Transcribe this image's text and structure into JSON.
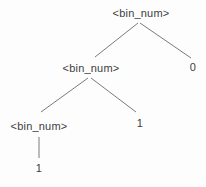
{
  "diagram": {
    "type": "parse-tree",
    "nodes": [
      {
        "id": "root",
        "label": "<bin_num>",
        "role": "nonterminal",
        "level": 0
      },
      {
        "id": "bin-num-2",
        "label": "<bin_num>",
        "role": "nonterminal",
        "level": 1
      },
      {
        "id": "leaf-0",
        "label": "0",
        "role": "terminal",
        "level": 1
      },
      {
        "id": "bin-num-3",
        "label": "<bin_num>",
        "role": "nonterminal",
        "level": 2
      },
      {
        "id": "leaf-1-mid",
        "label": "1",
        "role": "terminal",
        "level": 2
      },
      {
        "id": "leaf-1-bot",
        "label": "1",
        "role": "terminal",
        "level": 3
      }
    ],
    "edges": [
      {
        "from": "root",
        "to": "bin-num-2"
      },
      {
        "from": "root",
        "to": "leaf-0"
      },
      {
        "from": "bin-num-2",
        "to": "bin-num-3"
      },
      {
        "from": "bin-num-2",
        "to": "leaf-1-mid"
      },
      {
        "from": "bin-num-3",
        "to": "leaf-1-bot"
      }
    ],
    "colors": {
      "background": "#fdfdfd",
      "text": "#3d3d3d",
      "line": "#7a7a7a"
    }
  }
}
